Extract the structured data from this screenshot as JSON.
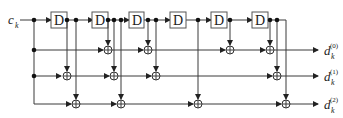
{
  "diagram": {
    "title": "",
    "input_label": "c",
    "input_subscript": "k",
    "delay_label": "D",
    "delay_count": 6,
    "outputs": [
      {
        "base": "d",
        "sub": "k",
        "sup": "(0)"
      },
      {
        "base": "d",
        "sub": "k",
        "sup": "(1)"
      },
      {
        "base": "d",
        "sub": "k",
        "sup": "(2)"
      }
    ],
    "node_types": [
      "delay",
      "adder",
      "junction"
    ],
    "colors": {
      "wire": "#3a3a3a",
      "box_border": "#555555",
      "background": "#ffffff"
    }
  }
}
